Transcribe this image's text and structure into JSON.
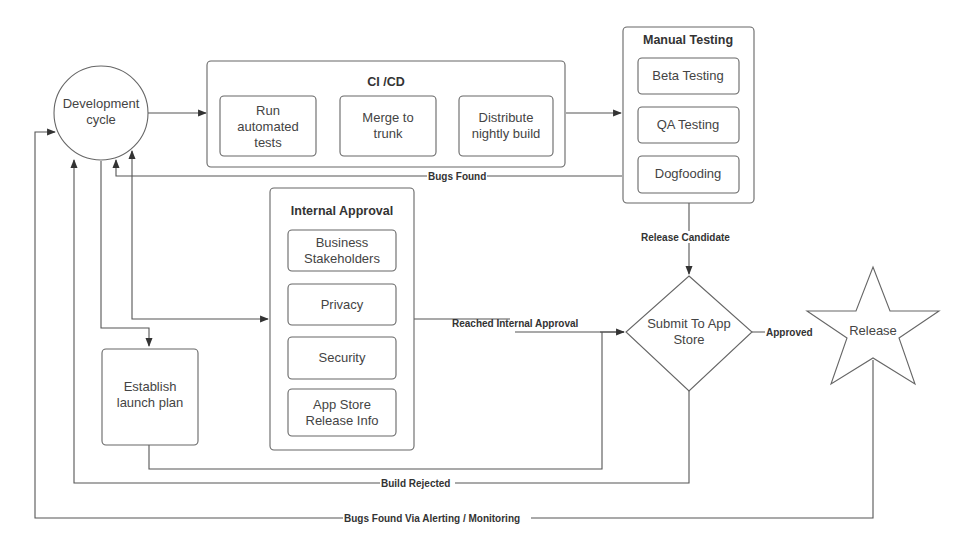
{
  "diagram": {
    "nodes": {
      "dev_cycle": {
        "line1": "Development",
        "line2": "cycle"
      },
      "cicd": {
        "title": "CI /CD",
        "steps": [
          {
            "line1": "Run",
            "line2": "automated",
            "line3": "tests"
          },
          {
            "line1": "Merge to",
            "line2": "trunk"
          },
          {
            "line1": "Distribute",
            "line2": "nightly build"
          }
        ]
      },
      "manual_testing": {
        "title": "Manual Testing",
        "steps": [
          "Beta Testing",
          "QA Testing",
          "Dogfooding"
        ]
      },
      "internal_approval": {
        "title": "Internal Approval",
        "steps": [
          {
            "line1": "Business",
            "line2": "Stakeholders"
          },
          {
            "line1": "Privacy"
          },
          {
            "line1": "Security"
          },
          {
            "line1": "App Store",
            "line2": "Release Info"
          }
        ]
      },
      "launch_plan": {
        "line1": "Establish",
        "line2": "launch plan"
      },
      "submit": {
        "line1": "Submit To App",
        "line2": "Store"
      },
      "release": {
        "label": "Release"
      }
    },
    "edges": {
      "bugs_found": "Bugs Found",
      "release_candidate": "Release Candidate",
      "reached_internal_approval": "Reached Internal Approval",
      "approved": "Approved",
      "build_rejected": "Build Rejected",
      "bugs_found_monitoring": "Bugs Found Via Alerting / Monitoring"
    }
  }
}
